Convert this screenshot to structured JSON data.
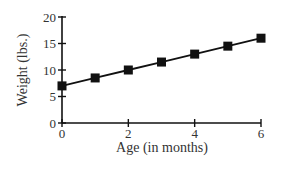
{
  "chart_data": {
    "type": "line",
    "title": "",
    "xlabel": "Age (in months)",
    "ylabel": "Weight (lbs.)",
    "x": [
      0,
      1,
      2,
      3,
      4,
      5,
      6
    ],
    "series": [
      {
        "name": "Weight",
        "values": [
          7,
          8.5,
          10,
          11.5,
          13,
          14.5,
          16
        ],
        "marker": "square",
        "color": "#111111"
      }
    ],
    "xlim": [
      0,
      6
    ],
    "ylim": [
      0,
      20
    ],
    "xticks": [
      0,
      2,
      4,
      6
    ],
    "yticks": [
      0,
      5,
      10,
      15,
      20
    ],
    "grid": false,
    "legend": "none"
  }
}
